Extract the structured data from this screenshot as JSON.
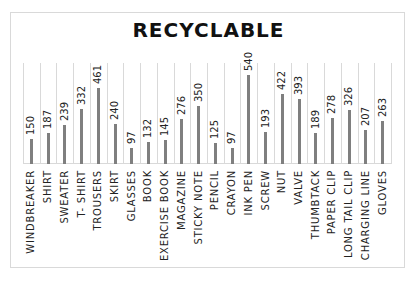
{
  "chart_data": {
    "type": "bar",
    "title": "RECYCLABLE",
    "xlabel": "",
    "ylabel": "",
    "ylim": [
      0,
      600
    ],
    "grid": "vertical category separators",
    "legend": "none",
    "data_labels": true,
    "categories": [
      "WINDBREAKER",
      "SHIRT",
      "SWEATER",
      "T- SHIRT",
      "TROUSERS",
      "SKIRT",
      "GLASSES",
      "BOOK",
      "EXERCISE BOOK",
      "MAGAZINE",
      "STICKY NOTE",
      "PENCIL",
      "CRAYON",
      "INK PEN",
      "SCREW",
      "NUT",
      "VALVE",
      "THUMBTACK",
      "PAPER CLIP",
      "LONG TAIL CLIP",
      "CHARGING LINE",
      "GLOVES"
    ],
    "values": [
      150,
      187,
      239,
      332,
      461,
      240,
      97,
      132,
      145,
      276,
      350,
      125,
      97,
      540,
      193,
      422,
      393,
      189,
      278,
      326,
      207,
      263
    ],
    "colors": {
      "bar": "#7f7f7f",
      "grid": "#d9d9d9"
    }
  }
}
